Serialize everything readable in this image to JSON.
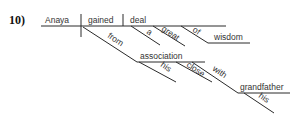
{
  "problem": {
    "number": "10)"
  },
  "diagram": {
    "subject": "Anaya",
    "verb": "gained",
    "object": "deal",
    "object_modifiers": [
      "a",
      "great"
    ],
    "object_prep": {
      "preposition": "of",
      "object": "wisdom"
    },
    "verb_prep": {
      "preposition": "from",
      "object": "association",
      "object_modifiers": [
        "his",
        "close"
      ],
      "nested_prep": {
        "preposition": "with",
        "object": "grandfather",
        "object_modifiers": [
          "his"
        ]
      }
    }
  },
  "colors": {
    "line": "#2a2a2a",
    "text": "#333333"
  }
}
